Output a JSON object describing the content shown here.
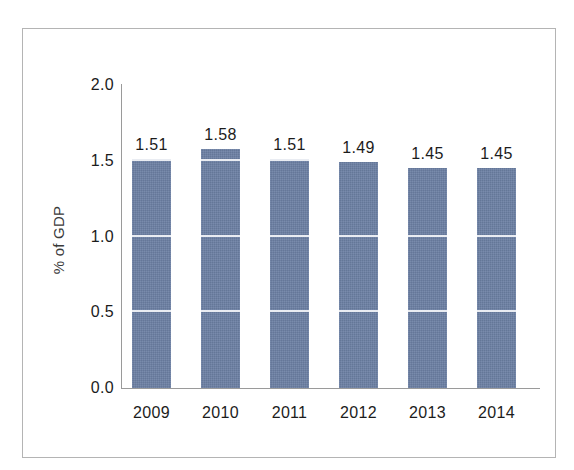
{
  "chart_data": {
    "type": "bar",
    "title": "",
    "subtitle": "",
    "xlabel": "",
    "ylabel": "% of GDP",
    "categories": [
      "2009",
      "2010",
      "2011",
      "2012",
      "2013",
      "2014"
    ],
    "values": [
      1.51,
      1.58,
      1.51,
      1.49,
      1.45,
      1.45
    ],
    "value_labels": [
      "1.51",
      "1.58",
      "1.51",
      "1.49",
      "1.45",
      "1.45"
    ],
    "ylim": [
      0.0,
      2.0
    ],
    "y_ticks": [
      0.0,
      0.5,
      1.0,
      1.5,
      2.0
    ],
    "y_tick_labels": [
      "0.0",
      "0.5",
      "1.0",
      "1.5",
      "2.0"
    ],
    "grid": "horizontal-gridlines-visible-over-bars-only",
    "legend": "none",
    "legend_position": "none",
    "bar_color": "#6b7fa3",
    "gridline_color": "#e9ecf2",
    "axis_color": "#9a9a9a",
    "text_color": "#1c1c1c",
    "frame_border_color": "#b4b4b4",
    "background_color": "#ffffff"
  }
}
